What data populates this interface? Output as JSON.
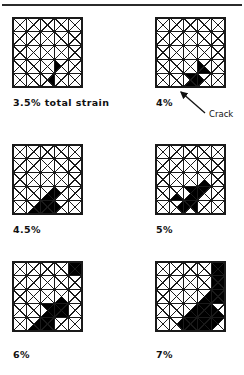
{
  "figure": {
    "type": "finite-element-mesh-series",
    "divider_present": true,
    "background_color": "#ffffff",
    "line_color": "#1a1a1a",
    "fill_color": "#000000",
    "grid": {
      "cols": 5,
      "rows": 5,
      "cell_diagonals": "both"
    }
  },
  "annotation": {
    "crack_label": "Crack",
    "arrow_from_x": 205,
    "arrow_from_y": 113,
    "arrow_to_x": 181,
    "arrow_to_y": 92
  },
  "panels": [
    {
      "id": "panel-3p5",
      "caption": "3.5% total strain",
      "strain_percent": 3.5,
      "left": 13,
      "top": 18,
      "size": 69,
      "filled_triangles": [
        {
          "col": 3,
          "row": 3,
          "part": "left"
        },
        {
          "col": 2,
          "row": 4,
          "part": "right"
        }
      ]
    },
    {
      "id": "panel-4",
      "caption": "4%",
      "strain_percent": 4,
      "left": 156,
      "top": 18,
      "size": 69,
      "filled_triangles": [
        {
          "col": 3,
          "row": 3,
          "part": "left"
        },
        {
          "col": 3,
          "row": 3,
          "part": "bottom"
        },
        {
          "col": 2,
          "row": 4,
          "part": "right"
        },
        {
          "col": 2,
          "row": 4,
          "part": "bottom"
        },
        {
          "col": 2,
          "row": 4,
          "part": "top"
        },
        {
          "col": 3,
          "row": 4,
          "part": "left"
        }
      ]
    },
    {
      "id": "panel-4p5",
      "caption": "4.5%",
      "strain_percent": 4.5,
      "left": 13,
      "top": 145,
      "size": 69,
      "filled_triangles": [
        {
          "col": 3,
          "row": 3,
          "part": "left"
        },
        {
          "col": 2,
          "row": 3,
          "part": "bottom"
        },
        {
          "col": 2,
          "row": 3,
          "part": "right"
        },
        {
          "col": 2,
          "row": 4,
          "part": "top"
        },
        {
          "col": 2,
          "row": 4,
          "part": "right"
        },
        {
          "col": 2,
          "row": 4,
          "part": "left"
        },
        {
          "col": 2,
          "row": 4,
          "part": "bottom"
        },
        {
          "col": 1,
          "row": 4,
          "part": "right"
        },
        {
          "col": 1,
          "row": 4,
          "part": "bottom"
        },
        {
          "col": 3,
          "row": 4,
          "part": "left"
        }
      ]
    },
    {
      "id": "panel-5",
      "caption": "5%",
      "strain_percent": 5,
      "left": 156,
      "top": 145,
      "size": 69,
      "filled_triangles": [
        {
          "col": 3,
          "row": 2,
          "part": "bottom"
        },
        {
          "col": 3,
          "row": 3,
          "part": "top"
        },
        {
          "col": 3,
          "row": 3,
          "part": "left"
        },
        {
          "col": 2,
          "row": 3,
          "part": "right"
        },
        {
          "col": 2,
          "row": 3,
          "part": "bottom"
        },
        {
          "col": 2,
          "row": 3,
          "part": "top"
        },
        {
          "col": 2,
          "row": 4,
          "part": "top"
        },
        {
          "col": 2,
          "row": 4,
          "part": "left"
        },
        {
          "col": 2,
          "row": 4,
          "part": "right"
        },
        {
          "col": 1,
          "row": 4,
          "part": "right"
        },
        {
          "col": 1,
          "row": 3,
          "part": "bottom"
        }
      ]
    },
    {
      "id": "panel-6",
      "caption": "6%",
      "strain_percent": 6,
      "left": 13,
      "top": 262,
      "size": 69,
      "filled_triangles": [
        {
          "col": 4,
          "row": 0,
          "part": "left"
        },
        {
          "col": 4,
          "row": 0,
          "part": "top"
        },
        {
          "col": 4,
          "row": 0,
          "part": "right"
        },
        {
          "col": 4,
          "row": 0,
          "part": "bottom"
        },
        {
          "col": 3,
          "row": 2,
          "part": "bottom"
        },
        {
          "col": 3,
          "row": 3,
          "part": "top"
        },
        {
          "col": 3,
          "row": 3,
          "part": "left"
        },
        {
          "col": 2,
          "row": 3,
          "part": "right"
        },
        {
          "col": 2,
          "row": 3,
          "part": "bottom"
        },
        {
          "col": 2,
          "row": 3,
          "part": "top"
        },
        {
          "col": 2,
          "row": 4,
          "part": "top"
        },
        {
          "col": 2,
          "row": 4,
          "part": "left"
        },
        {
          "col": 2,
          "row": 4,
          "part": "right"
        },
        {
          "col": 2,
          "row": 4,
          "part": "bottom"
        },
        {
          "col": 1,
          "row": 4,
          "part": "right"
        },
        {
          "col": 1,
          "row": 4,
          "part": "bottom"
        },
        {
          "col": 3,
          "row": 3,
          "part": "right"
        },
        {
          "col": 3,
          "row": 3,
          "part": "bottom"
        }
      ]
    },
    {
      "id": "panel-7",
      "caption": "7%",
      "strain_percent": 7,
      "left": 156,
      "top": 262,
      "size": 69,
      "filled_triangles": [
        {
          "col": 4,
          "row": 0,
          "part": "left"
        },
        {
          "col": 4,
          "row": 0,
          "part": "top"
        },
        {
          "col": 4,
          "row": 0,
          "part": "right"
        },
        {
          "col": 4,
          "row": 0,
          "part": "bottom"
        },
        {
          "col": 4,
          "row": 1,
          "part": "left"
        },
        {
          "col": 4,
          "row": 1,
          "part": "top"
        },
        {
          "col": 4,
          "row": 1,
          "part": "right"
        },
        {
          "col": 4,
          "row": 1,
          "part": "bottom"
        },
        {
          "col": 4,
          "row": 2,
          "part": "left"
        },
        {
          "col": 4,
          "row": 2,
          "part": "top"
        },
        {
          "col": 4,
          "row": 2,
          "part": "right"
        },
        {
          "col": 4,
          "row": 2,
          "part": "bottom"
        },
        {
          "col": 3,
          "row": 2,
          "part": "right"
        },
        {
          "col": 3,
          "row": 2,
          "part": "bottom"
        },
        {
          "col": 3,
          "row": 3,
          "part": "top"
        },
        {
          "col": 3,
          "row": 3,
          "part": "left"
        },
        {
          "col": 3,
          "row": 3,
          "part": "right"
        },
        {
          "col": 3,
          "row": 3,
          "part": "bottom"
        },
        {
          "col": 4,
          "row": 3,
          "part": "left"
        },
        {
          "col": 4,
          "row": 3,
          "part": "bottom"
        },
        {
          "col": 4,
          "row": 4,
          "part": "top"
        },
        {
          "col": 4,
          "row": 4,
          "part": "left"
        },
        {
          "col": 2,
          "row": 3,
          "part": "right"
        },
        {
          "col": 2,
          "row": 3,
          "part": "bottom"
        },
        {
          "col": 2,
          "row": 4,
          "part": "top"
        },
        {
          "col": 2,
          "row": 4,
          "part": "right"
        },
        {
          "col": 2,
          "row": 4,
          "part": "left"
        },
        {
          "col": 2,
          "row": 4,
          "part": "bottom"
        },
        {
          "col": 3,
          "row": 4,
          "part": "left"
        },
        {
          "col": 3,
          "row": 4,
          "part": "top"
        },
        {
          "col": 3,
          "row": 4,
          "part": "right"
        },
        {
          "col": 3,
          "row": 4,
          "part": "bottom"
        },
        {
          "col": 1,
          "row": 4,
          "part": "right"
        }
      ]
    }
  ],
  "captions": {
    "panel_3p5": "3.5% total strain",
    "panel_4": "4%",
    "panel_4p5": "4.5%",
    "panel_5": "5%",
    "panel_6": "6%",
    "panel_7": "7%"
  },
  "caption_positions": [
    {
      "left": 13,
      "top": 97
    },
    {
      "left": 156,
      "top": 97
    },
    {
      "left": 13,
      "top": 224
    },
    {
      "left": 156,
      "top": 224
    },
    {
      "left": 13,
      "top": 349
    },
    {
      "left": 156,
      "top": 349
    }
  ]
}
